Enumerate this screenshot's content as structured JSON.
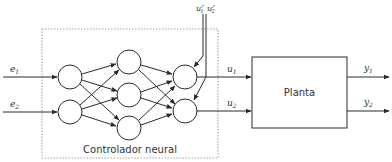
{
  "diagram": {
    "controller_label": "Controlador neural",
    "plant_label": "Planta",
    "inputs": [
      {
        "name": "e",
        "sub": "1"
      },
      {
        "name": "e",
        "sub": "2"
      }
    ],
    "control_outputs": [
      {
        "name": "u",
        "sub": "1"
      },
      {
        "name": "u",
        "sub": "2"
      }
    ],
    "reference_inputs": [
      {
        "name": "u",
        "sub": "1",
        "sup": "r"
      },
      {
        "name": "u",
        "sub": "2",
        "sup": "r"
      }
    ],
    "plant_outputs": [
      {
        "name": "y",
        "sub": "1"
      },
      {
        "name": "y",
        "sub": "2"
      }
    ],
    "network_layers": [
      2,
      3,
      2
    ],
    "colors": {
      "stroke": "#2a2a2a",
      "dashed": "#8a8a8a",
      "text": "#333333",
      "background": "#ffffff"
    }
  }
}
